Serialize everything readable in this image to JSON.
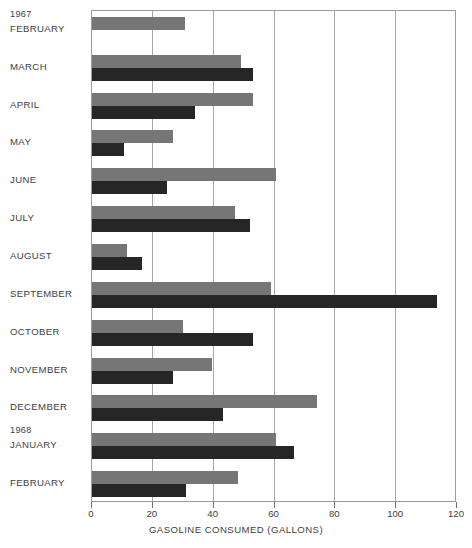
{
  "chart_data": {
    "type": "bar",
    "title": "",
    "subtitle": "",
    "orientation": "horizontal",
    "xlabel": "GASOLINE CONSUMED (GALLONS)",
    "ylabel": "",
    "xlim": [
      0,
      120
    ],
    "xticks": [
      0,
      20,
      40,
      60,
      80,
      100,
      120
    ],
    "grid": true,
    "legend": null,
    "group_labels": [
      "1967",
      "1968"
    ],
    "categories": [
      "FEBRUARY",
      "MARCH",
      "APRIL",
      "MAY",
      "JUNE",
      "JULY",
      "AUGUST",
      "SEPTEMBER",
      "OCTOBER",
      "NOVEMBER",
      "DECEMBER",
      "JANUARY",
      "FEBRUARY"
    ],
    "category_years": [
      "1967",
      "1967",
      "1967",
      "1967",
      "1967",
      "1967",
      "1967",
      "1967",
      "1967",
      "1967",
      "1967",
      "1968",
      "1968"
    ],
    "series": [
      {
        "name": "upper-bar",
        "color": "#767676",
        "values": [
          30.5,
          49.0,
          53.0,
          26.5,
          60.5,
          47.0,
          11.5,
          59.0,
          30.0,
          39.5,
          74.0,
          60.5,
          48.0
        ]
      },
      {
        "name": "lower-bar",
        "color": "#262626",
        "values": [
          0,
          53.0,
          34.0,
          10.5,
          24.5,
          52.0,
          16.5,
          113.5,
          53.0,
          26.5,
          43.0,
          66.5,
          31.0
        ]
      }
    ]
  },
  "axis": {
    "x_tick_labels": [
      "0",
      "20",
      "40",
      "60",
      "80",
      "100",
      "120"
    ],
    "x_axis_title": "GASOLINE CONSUMED (GALLONS)"
  },
  "colors": {
    "bar_upper": "#767676",
    "bar_lower": "#262626",
    "grid": "#a8a8a8",
    "frame": "#9a9a9a",
    "text": "#414141",
    "background": "#ffffff"
  }
}
